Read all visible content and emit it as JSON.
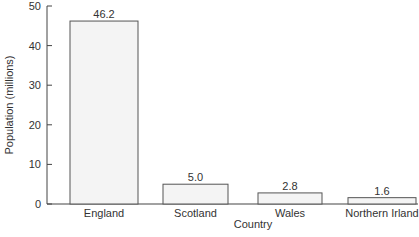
{
  "chart_data": {
    "type": "bar",
    "title": "",
    "xlabel": "Country",
    "ylabel": "Population (millions)",
    "categories": [
      "England",
      "Scotland",
      "Wales",
      "Northern Irland"
    ],
    "values": [
      46.2,
      5.0,
      2.8,
      1.6
    ],
    "value_labels": [
      "46.2",
      "5.0",
      "2.8",
      "1.6"
    ],
    "ylim": [
      0,
      50
    ],
    "yticks": [
      0,
      10,
      20,
      30,
      40,
      50
    ],
    "grid": false,
    "legend": null,
    "bar_fill": "#f4f4f4",
    "bar_stroke": "#555555"
  }
}
